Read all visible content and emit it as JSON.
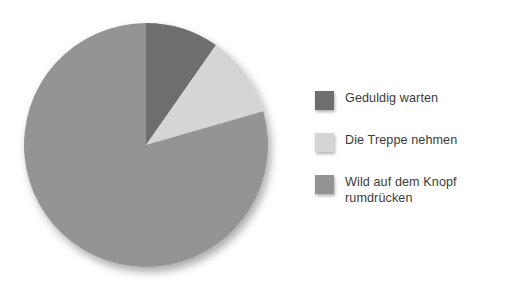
{
  "chart_data": {
    "type": "pie",
    "title": "",
    "subtitle": "",
    "xlabel": "",
    "ylabel": "",
    "grid": false,
    "legend_position": "right",
    "categories": [
      "Geduldig warten",
      "Die Treppe nehmen",
      "Wild auf dem Knopf rumdrücken"
    ],
    "values": [
      9.7,
      10.8,
      79.5
    ],
    "unit": "%",
    "start_angle_deg": 0,
    "direction": "clockwise",
    "slices": [
      {
        "label": "Geduldig warten",
        "value": 9.7,
        "angle_deg": 35,
        "color": "#6e6e6e",
        "start_deg": 0,
        "end_deg": 35
      },
      {
        "label": "Die Treppe nehmen",
        "value": 10.8,
        "angle_deg": 39,
        "color": "#d5d5d5",
        "start_deg": 35,
        "end_deg": 74
      },
      {
        "label": "Wild auf dem Knopf rumdrücken",
        "value": 79.5,
        "angle_deg": 286,
        "color": "#949494",
        "start_deg": 74,
        "end_deg": 360
      }
    ]
  },
  "legend": {
    "items": [
      {
        "label": "Geduldig warten",
        "color": "#6e6e6e"
      },
      {
        "label": "Die Treppe nehmen",
        "color": "#d5d5d5"
      },
      {
        "label": "Wild auf dem Knopf\nrumdrücken",
        "color": "#949494"
      }
    ]
  },
  "colors": {
    "background": "#ffffff",
    "text": "#3b3b3b",
    "slice_dark": "#6e6e6e",
    "slice_light": "#d5d5d5",
    "slice_medium": "#949494"
  }
}
